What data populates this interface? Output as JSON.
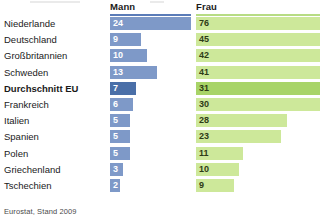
{
  "chart_data": {
    "type": "bar",
    "title": "",
    "xlabel": "",
    "ylabel": "",
    "orientation": "horizontal",
    "grid": false,
    "legend_position": "top",
    "categories": [
      "Niederlande",
      "Deutschland",
      "Großbritannien",
      "Schweden",
      "Durchschnitt EU",
      "Frankreich",
      "Italien",
      "Spanien",
      "Polen",
      "Griechenland",
      "Tschechien"
    ],
    "series": [
      {
        "name": "Mann",
        "values": [
          24,
          9,
          10,
          13,
          7,
          6,
          5,
          5,
          5,
          3,
          2
        ],
        "color": "#7E99C8",
        "highlight_color": "#4A6FA8",
        "bar_pixel_widths": [
          81,
          31,
          37,
          47,
          26,
          23,
          20,
          20,
          20,
          13,
          10
        ]
      },
      {
        "name": "Frau",
        "values": [
          76,
          45,
          42,
          41,
          31,
          30,
          28,
          23,
          11,
          10,
          9
        ],
        "color": "#CDE89A",
        "highlight_color": "#A8D468",
        "bar_pixel_widths": [
          124,
          124,
          124,
          124,
          124,
          124,
          91,
          85,
          47,
          43,
          38
        ]
      }
    ],
    "highlight_category": "Durchschnitt EU",
    "source": "Eurostat, Stand 2009"
  },
  "headers": {
    "mann": "Mann",
    "frau": "Frau"
  },
  "footer": {
    "source": "Eurostat, Stand 2009"
  }
}
